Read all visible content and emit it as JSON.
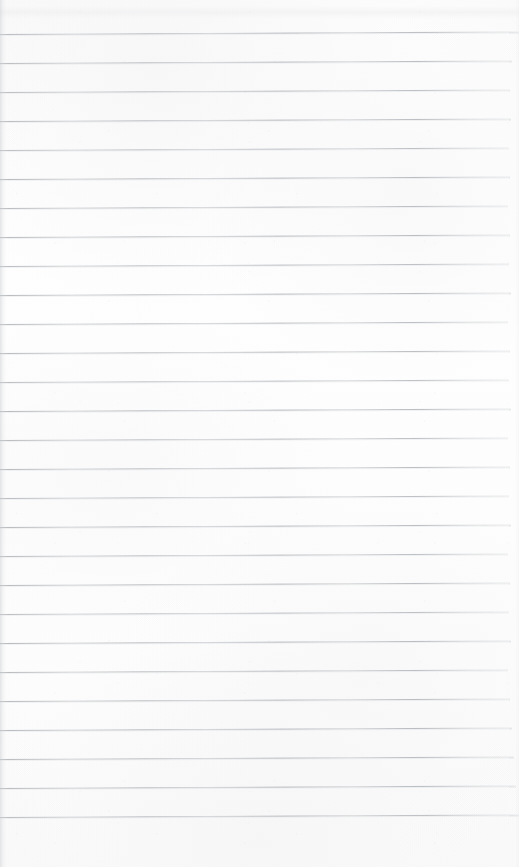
{
  "document": {
    "kind": "scanned-lined-paper",
    "title": "Blank ruled notebook page",
    "content_text": "",
    "is_blank": true,
    "page_width": 519,
    "page_height": 867
  },
  "paper": {
    "background_color": "#fdfdfd",
    "edge_shadow_color": "#ced0d3",
    "vignette_color": "#e9e9eb"
  },
  "ruling": {
    "line_color": "#b0b4b8",
    "line_thickness": 1,
    "line_spacing": 29,
    "first_line_y": 34,
    "left_x": 0,
    "right_x": 509,
    "skew_degrees": -0.28,
    "line_count": 28,
    "lines": [
      {
        "y": 34,
        "x_start": 0,
        "x_end": 519,
        "opacity": 0.95
      },
      {
        "y": 63,
        "x_start": 0,
        "x_end": 512,
        "opacity": 0.92
      },
      {
        "y": 92,
        "x_start": 0,
        "x_end": 510,
        "opacity": 0.9
      },
      {
        "y": 121,
        "x_start": 0,
        "x_end": 511,
        "opacity": 0.93
      },
      {
        "y": 150,
        "x_start": 0,
        "x_end": 509,
        "opacity": 0.88
      },
      {
        "y": 179,
        "x_start": 0,
        "x_end": 510,
        "opacity": 0.94
      },
      {
        "y": 208,
        "x_start": 0,
        "x_end": 508,
        "opacity": 0.9
      },
      {
        "y": 237,
        "x_start": 0,
        "x_end": 510,
        "opacity": 0.92
      },
      {
        "y": 266,
        "x_start": 0,
        "x_end": 509,
        "opacity": 0.89
      },
      {
        "y": 295,
        "x_start": 0,
        "x_end": 511,
        "opacity": 0.93
      },
      {
        "y": 324,
        "x_start": 0,
        "x_end": 508,
        "opacity": 0.9
      },
      {
        "y": 353,
        "x_start": 0,
        "x_end": 510,
        "opacity": 0.91
      },
      {
        "y": 382,
        "x_start": 0,
        "x_end": 509,
        "opacity": 0.88
      },
      {
        "y": 411,
        "x_start": 0,
        "x_end": 511,
        "opacity": 0.94
      },
      {
        "y": 440,
        "x_start": 0,
        "x_end": 508,
        "opacity": 0.9
      },
      {
        "y": 469,
        "x_start": 0,
        "x_end": 510,
        "opacity": 0.92
      },
      {
        "y": 498,
        "x_start": 0,
        "x_end": 509,
        "opacity": 0.89
      },
      {
        "y": 527,
        "x_start": 0,
        "x_end": 511,
        "opacity": 0.93
      },
      {
        "y": 556,
        "x_start": 0,
        "x_end": 508,
        "opacity": 0.9
      },
      {
        "y": 585,
        "x_start": 0,
        "x_end": 510,
        "opacity": 0.92
      },
      {
        "y": 614,
        "x_start": 0,
        "x_end": 509,
        "opacity": 0.88
      },
      {
        "y": 643,
        "x_start": 0,
        "x_end": 511,
        "opacity": 0.94
      },
      {
        "y": 672,
        "x_start": 0,
        "x_end": 508,
        "opacity": 0.91
      },
      {
        "y": 701,
        "x_start": 0,
        "x_end": 510,
        "opacity": 0.93
      },
      {
        "y": 730,
        "x_start": 0,
        "x_end": 512,
        "opacity": 0.95
      },
      {
        "y": 759,
        "x_start": 0,
        "x_end": 514,
        "opacity": 0.93
      },
      {
        "y": 788,
        "x_start": 0,
        "x_end": 516,
        "opacity": 0.94
      },
      {
        "y": 817,
        "x_start": 0,
        "x_end": 519,
        "opacity": 0.92
      }
    ]
  },
  "margins": {
    "top_blank_height": 34,
    "bottom_blank_height": 50
  }
}
